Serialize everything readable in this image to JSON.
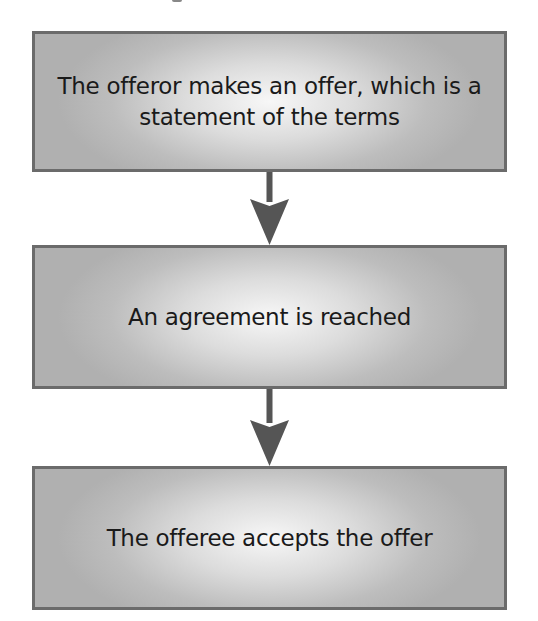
{
  "diagram": {
    "type": "flowchart",
    "direction": "top-to-bottom",
    "steps": [
      {
        "id": "step-1",
        "label": "The offeror makes an offer, which is a statement of the terms"
      },
      {
        "id": "step-2",
        "label": "An agreement is reached"
      },
      {
        "id": "step-3",
        "label": "The offeree accepts the offer"
      }
    ],
    "connectors": [
      {
        "from": "step-1",
        "to": "step-2",
        "icon": "arrow-down-icon"
      },
      {
        "from": "step-2",
        "to": "step-3",
        "icon": "arrow-down-icon"
      }
    ]
  },
  "colors": {
    "box_border": "#6b6b6b",
    "box_fill_edge": "#b0b0b0",
    "box_fill_center": "#f7f7f7",
    "arrow": "#555555",
    "text": "#1a1a1a",
    "background": "#ffffff"
  }
}
